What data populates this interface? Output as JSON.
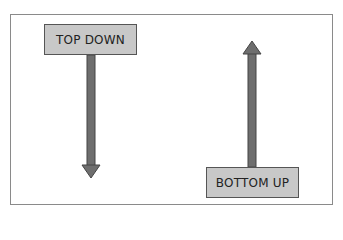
{
  "diagram": {
    "top_down": {
      "label": "TOP DOWN",
      "direction": "down"
    },
    "bottom_up": {
      "label": "BOTTOM UP",
      "direction": "up"
    },
    "colors": {
      "box_fill": "#c8c8c8",
      "arrow_fill": "#6e6e6e",
      "border": "#555555"
    }
  }
}
